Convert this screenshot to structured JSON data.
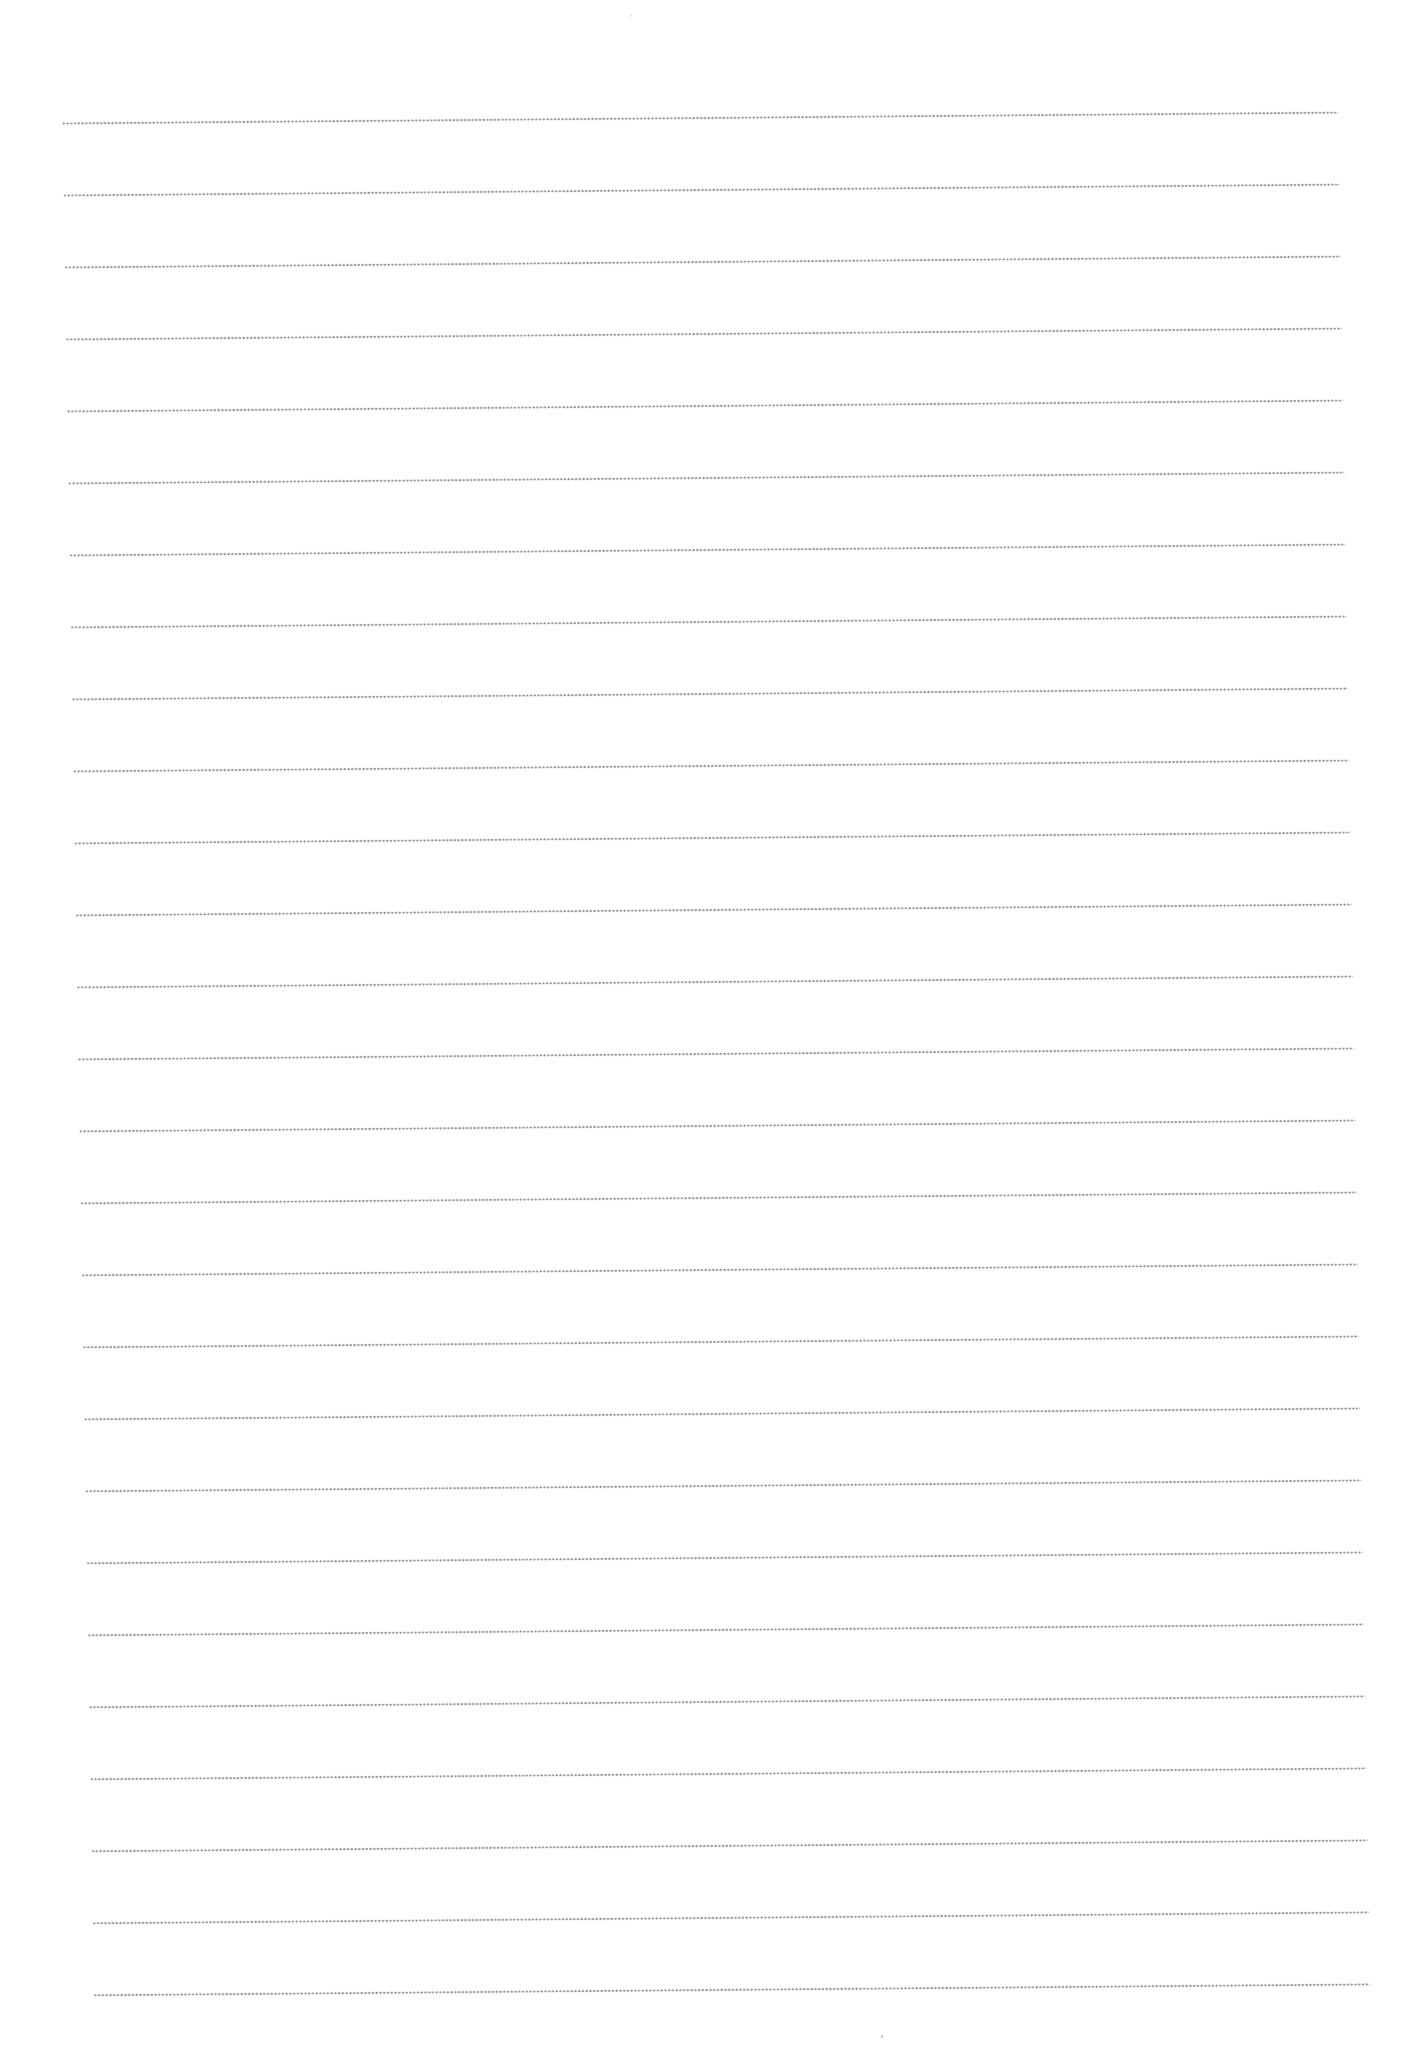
{
  "page": {
    "type": "blank ruled sheet",
    "background_color": "#ffffff",
    "rule_style": "dotted",
    "rule_color": "#8a8a8a",
    "line_count": 27,
    "line_spacing_px": 72
  },
  "lines": [
    {
      "index": 1
    },
    {
      "index": 2
    },
    {
      "index": 3
    },
    {
      "index": 4
    },
    {
      "index": 5
    },
    {
      "index": 6
    },
    {
      "index": 7
    },
    {
      "index": 8
    },
    {
      "index": 9
    },
    {
      "index": 10
    },
    {
      "index": 11
    },
    {
      "index": 12
    },
    {
      "index": 13
    },
    {
      "index": 14
    },
    {
      "index": 15
    },
    {
      "index": 16
    },
    {
      "index": 17
    },
    {
      "index": 18
    },
    {
      "index": 19
    },
    {
      "index": 20
    },
    {
      "index": 21
    },
    {
      "index": 22
    },
    {
      "index": 23
    },
    {
      "index": 24
    },
    {
      "index": 25
    },
    {
      "index": 26
    },
    {
      "index": 27
    }
  ]
}
